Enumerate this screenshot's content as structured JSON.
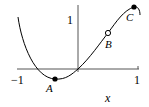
{
  "figure": {
    "x_axis": {
      "label": "x",
      "tick_min_label": "−1",
      "tick_max_label": "1"
    },
    "y_axis": {
      "tick_label": "1"
    },
    "points": [
      {
        "name": "A",
        "style": "filled"
      },
      {
        "name": "B",
        "style": "open"
      },
      {
        "name": "C",
        "style": "filled"
      }
    ],
    "colors": {
      "stroke": "#000000",
      "background": "#ffffff"
    }
  }
}
